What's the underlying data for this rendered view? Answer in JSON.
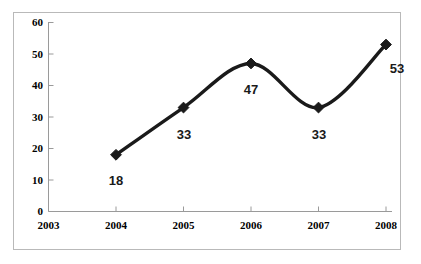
{
  "chart_data": {
    "type": "line",
    "title": "",
    "subtitle": "",
    "xlabel": "",
    "ylabel": "",
    "x": [
      "2003",
      "2004",
      "2005",
      "2006",
      "2007",
      "2008"
    ],
    "categories": [
      "2003",
      "2004",
      "2005",
      "2006",
      "2007",
      "2008"
    ],
    "values": [
      null,
      18,
      33,
      47,
      33,
      53
    ],
    "series": [
      {
        "name": "",
        "points": [
          {
            "x": "2004",
            "y": 18,
            "label": "18"
          },
          {
            "x": "2005",
            "y": 33,
            "label": "33"
          },
          {
            "x": "2006",
            "y": 47,
            "label": "47"
          },
          {
            "x": "2007",
            "y": 33,
            "label": "33"
          },
          {
            "x": "2008",
            "y": 53,
            "label": "53"
          }
        ]
      }
    ],
    "data_labels": [
      "18",
      "33",
      "47",
      "33",
      "53"
    ],
    "ylim": [
      0,
      60
    ],
    "yticks": [
      0,
      10,
      20,
      30,
      40,
      50,
      60
    ],
    "ytick_labels": [
      "0",
      "10",
      "20",
      "30",
      "40",
      "50",
      "60"
    ],
    "xtick_labels": [
      "2003",
      "2004",
      "2005",
      "2006",
      "2007",
      "2008"
    ],
    "grid": false,
    "legend": "none",
    "smooth": true,
    "marker": "diamond",
    "colors": {
      "line": "#1a1a1a",
      "marker": "#1a1a1a",
      "axis": "#9a9a9a",
      "border": "#b9b9b9",
      "background": "#ffffff",
      "label_text": "#1a1a1a"
    }
  },
  "axes": {
    "y": {
      "t60": "60",
      "t50": "50",
      "t40": "40",
      "t30": "30",
      "t20": "20",
      "t10": "10",
      "t0": "0"
    },
    "x": {
      "t2003": "2003",
      "t2004": "2004",
      "t2005": "2005",
      "t2006": "2006",
      "t2007": "2007",
      "t2008": "2008"
    }
  },
  "labels": {
    "p2004": "18",
    "p2005": "33",
    "p2006": "47",
    "p2007": "33",
    "p2008": "53"
  }
}
